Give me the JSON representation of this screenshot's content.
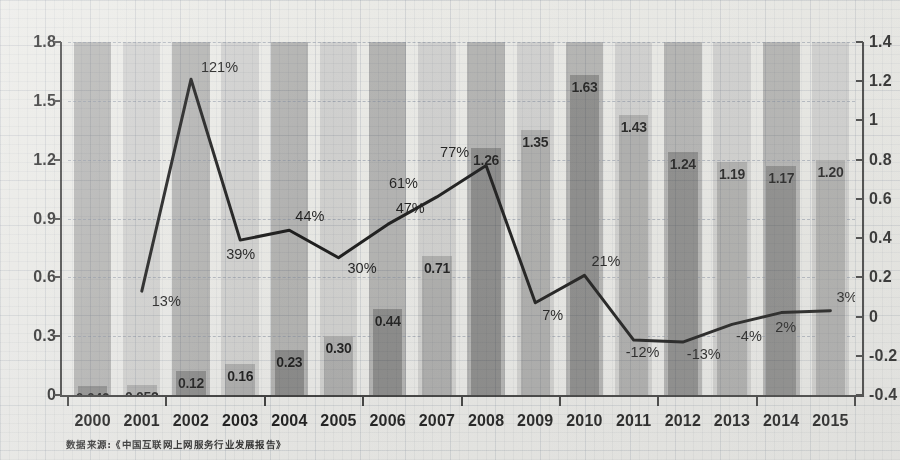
{
  "chart_data": {
    "type": "bar",
    "title": "",
    "subtitle": "",
    "xlabel": "",
    "ylabel": "",
    "grid": true,
    "legend_position": "none",
    "categories": [
      "2000",
      "2001",
      "2002",
      "2003",
      "2004",
      "2005",
      "2006",
      "2007",
      "2008",
      "2009",
      "2010",
      "2011",
      "2012",
      "2013",
      "2014",
      "2015"
    ],
    "left_axis": {
      "ticks": [
        "0",
        "0.3",
        "0.6",
        "0.9",
        "1.2",
        "1.5",
        "1.8"
      ],
      "tick_values": [
        0,
        0.3,
        0.6,
        0.9,
        1.2,
        1.5,
        1.8
      ],
      "ylim": [
        0,
        1.8
      ]
    },
    "right_axis": {
      "ticks": [
        "-0.4",
        "-0.2",
        "0",
        "0.2",
        "0.4",
        "0.6",
        "0.8",
        "1",
        "1.2",
        "1.4"
      ],
      "tick_values": [
        -0.4,
        -0.2,
        0,
        0.2,
        0.4,
        0.6,
        0.8,
        1.0,
        1.2,
        1.4
      ],
      "ylim": [
        -0.4,
        1.4
      ]
    },
    "series": [
      {
        "name": "bars",
        "axis": "left",
        "type": "bar",
        "values": [
          0.046,
          0.052,
          0.12,
          0.16,
          0.23,
          0.3,
          0.44,
          0.71,
          1.26,
          1.35,
          1.63,
          1.43,
          1.24,
          1.19,
          1.17,
          1.2
        ],
        "labels": [
          "0.046",
          "0.052",
          "0.12",
          "0.16",
          "0.23",
          "0.30",
          "0.44",
          "0.71",
          "1.26",
          "1.35",
          "1.63",
          "1.43",
          "1.24",
          "1.19",
          "1.17",
          "1.20"
        ]
      },
      {
        "name": "growth-rate",
        "axis": "right",
        "type": "line",
        "values": [
          null,
          0.13,
          1.21,
          0.39,
          0.44,
          0.3,
          0.47,
          0.61,
          0.77,
          0.07,
          0.21,
          -0.12,
          -0.13,
          -0.04,
          0.02,
          0.03
        ],
        "labels": [
          "",
          "13%",
          "121%",
          "39%",
          "44%",
          "30%",
          "47%",
          "61%",
          "77%",
          "7%",
          "21%",
          "-12%",
          "-13%",
          "-4%",
          "2%",
          "3%"
        ]
      }
    ],
    "colors": {
      "bar_dark": "#8a8a8a",
      "bar_light": "#b0b0b0",
      "band_dark": "#b6b6b6",
      "band_light": "#d6d6d6",
      "line": "#111111",
      "text": "#141414"
    }
  },
  "caption": {
    "text": "数据来源:《中国互联网上网服务行业发展报告》"
  }
}
